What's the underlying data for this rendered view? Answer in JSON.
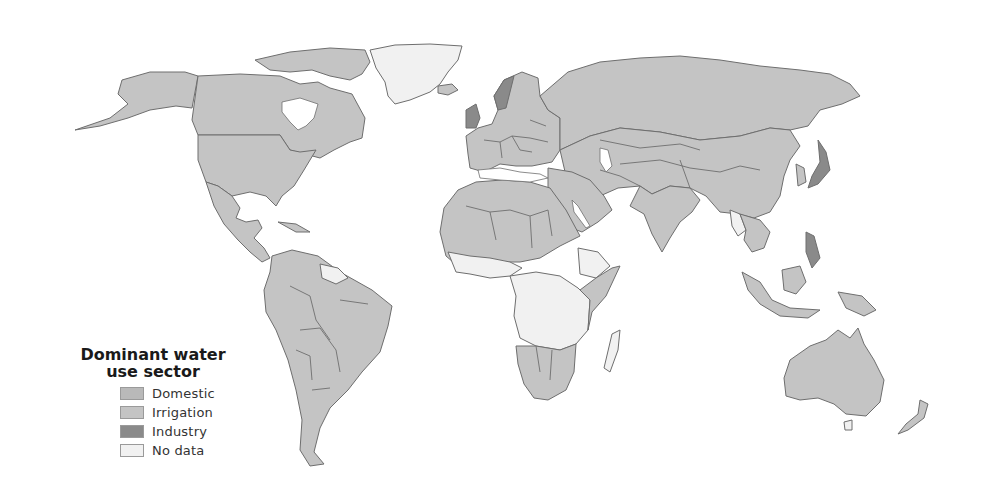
{
  "map": {
    "type": "choropleth world map",
    "colors": {
      "domestic": "#b9b9b9",
      "irrigation": "#c4c4c4",
      "industry": "#8a8a8a",
      "no_data": "#f1f1f1",
      "border": "#6e6e6e",
      "water": "#ffffff"
    }
  },
  "legend": {
    "title_line1": "Dominant water",
    "title_line2": "use sector",
    "items": [
      {
        "label": "Domestic",
        "color": "#b9b9b9"
      },
      {
        "label": "Irrigation",
        "color": "#c4c4c4"
      },
      {
        "label": "Industry",
        "color": "#8a8a8a"
      },
      {
        "label": "No data",
        "color": "#f1f1f1"
      }
    ]
  }
}
